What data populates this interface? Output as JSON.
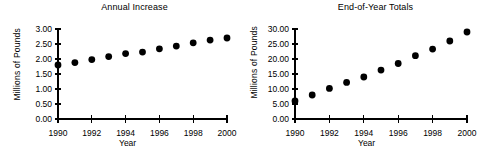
{
  "figure": {
    "width": 490,
    "height": 158,
    "background": "#ffffff",
    "foreground": "#000000",
    "marker_color": "#000000"
  },
  "chart_data": [
    {
      "type": "scatter",
      "panel": "left",
      "title": "Annual Increase",
      "xlabel": "Year",
      "ylabel": "Millions of Pounds",
      "grid": false,
      "legend": null,
      "xlim": [
        1990,
        2000
      ],
      "ylim": [
        0.0,
        3.0
      ],
      "xticks": [
        1990,
        1992,
        1994,
        1996,
        1998,
        2000
      ],
      "xtick_labels": [
        "1990",
        "1992",
        "1994",
        "1996",
        "1998",
        "2000"
      ],
      "yticks": [
        0.0,
        0.5,
        1.0,
        1.5,
        2.0,
        2.5,
        3.0
      ],
      "ytick_labels": [
        "0.00",
        "0.50",
        "1.00",
        "1.50",
        "2.00",
        "2.50",
        "3.00"
      ],
      "x": [
        1990,
        1991,
        1992,
        1993,
        1994,
        1995,
        1996,
        1997,
        1998,
        1999,
        2000
      ],
      "values": [
        1.8,
        1.88,
        1.98,
        2.08,
        2.18,
        2.23,
        2.34,
        2.43,
        2.54,
        2.63,
        2.7
      ]
    },
    {
      "type": "scatter",
      "panel": "right",
      "title": "End-of-Year Totals",
      "xlabel": "Year",
      "ylabel": "Millions of Pounds",
      "grid": false,
      "legend": null,
      "xlim": [
        1990,
        2000
      ],
      "ylim": [
        0.0,
        30.0
      ],
      "xticks": [
        1990,
        1992,
        1994,
        1996,
        1998,
        2000
      ],
      "xtick_labels": [
        "1990",
        "1992",
        "1994",
        "1996",
        "1998",
        "2000"
      ],
      "yticks": [
        0.0,
        5.0,
        10.0,
        15.0,
        20.0,
        25.0,
        30.0
      ],
      "ytick_labels": [
        "0.00",
        "5.00",
        "10.00",
        "15.00",
        "20.00",
        "25.00",
        "30.00"
      ],
      "x": [
        1990,
        1991,
        1992,
        1993,
        1994,
        1995,
        1996,
        1997,
        1998,
        1999,
        2000
      ],
      "values": [
        6.0,
        8.0,
        10.2,
        12.2,
        14.0,
        16.3,
        18.5,
        21.1,
        23.3,
        26.0,
        29.0
      ]
    }
  ]
}
